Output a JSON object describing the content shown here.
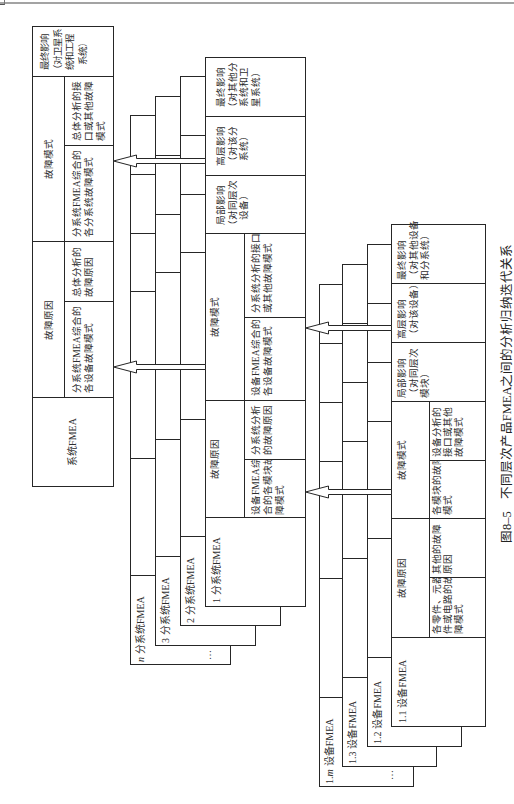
{
  "figure": {
    "caption": {
      "number": "图8–5",
      "title": "不同层次产品FMEA之间的分析归纳迭代关系"
    }
  },
  "system_fmea": {
    "name": "系统FMEA",
    "failure_cause": {
      "header": "故障原因",
      "items": [
        "分系统FMEA综合的\n各设备故障模式",
        "总体分析的\n故障原因"
      ]
    },
    "failure_mode": {
      "header": "故障模式",
      "items": [
        "分系统FMEA综合的\n各分系统故障模式",
        "总体分析的接\n口或其他故障\n模式"
      ]
    },
    "final_effect": "最终影响\n（对卫星系\n统和工程\n系统）"
  },
  "subsystem_fmea": {
    "label": {
      "num": "1",
      "var": "",
      "name": "分系统FMEA"
    },
    "failure_cause": {
      "header": "故障原因",
      "items": [
        "设备FMEA综\n合的各模块故\n障模式",
        "分系统分析\n的故障原因"
      ]
    },
    "failure_mode": {
      "header": "故障模式",
      "items": [
        "设备FMEA综合的\n各设备故障模式",
        "分系统分析的接口\n或其他故障模式"
      ]
    },
    "local_effect": "局部影响\n（对同层次\n设备）",
    "higher_effect": "高层影响\n（对该分\n系统）",
    "final_effect": "最终影响\n（对其他分\n系统和卫\n星系统）",
    "stack": [
      {
        "num": "2",
        "var": "",
        "name": "分系统FMEA"
      },
      {
        "num": "3",
        "var": "",
        "name": "分系统FMEA"
      },
      {
        "num": "",
        "var": "n",
        "name": "分系统FMEA"
      }
    ],
    "ellipsis": "…"
  },
  "equipment_fmea": {
    "label": {
      "num": "1.1",
      "var": "",
      "name": "设备FMEA"
    },
    "failure_cause": {
      "header": "故障原因",
      "items": [
        "各零件、元器\n件或电路的故\n障模式",
        "其他的故障\n原因"
      ]
    },
    "failure_mode": {
      "header": "故障模式",
      "items": [
        "各模块的故障\n模式",
        "设备分析的\n接口或其他\n故障模式"
      ]
    },
    "local_effect": "局部影响\n（对同层次\n模块）",
    "higher_effect": "高层影响\n（对该设备）",
    "final_effect": "最终影响\n（对其他设备\n和分系统）",
    "stack": [
      {
        "num": "1.2",
        "var": "",
        "name": "设备FMEA"
      },
      {
        "num": "1.3",
        "var": "",
        "name": "设备FMEA"
      },
      {
        "num": "1.",
        "var": "m",
        "name": "设备FMEA"
      }
    ],
    "ellipsis": "…"
  }
}
